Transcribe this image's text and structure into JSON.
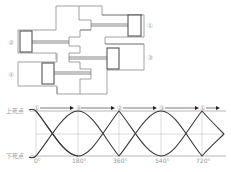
{
  "engine_diagram": {
    "cylinders": [
      {
        "id": 1,
        "label": "①",
        "side": "right",
        "position": "upper"
      },
      {
        "id": 2,
        "label": "②",
        "side": "left",
        "position": "upper"
      },
      {
        "id": 3,
        "label": "③",
        "side": "right",
        "position": "lower"
      },
      {
        "id": 4,
        "label": "④",
        "side": "left",
        "position": "lower"
      }
    ],
    "colors": {
      "outline": "#8a8a8a",
      "piston": "#555555"
    }
  },
  "timing_chart": {
    "top_label": "上死点",
    "bottom_label": "下死点",
    "sequence": [
      "①",
      "④",
      "②",
      "③",
      "①"
    ],
    "x_ticks": [
      "0°",
      "180°",
      "360°",
      "540°",
      "720°"
    ],
    "colors": {
      "wave": "#3a3a3a",
      "grid": "#b5b5b5"
    }
  }
}
